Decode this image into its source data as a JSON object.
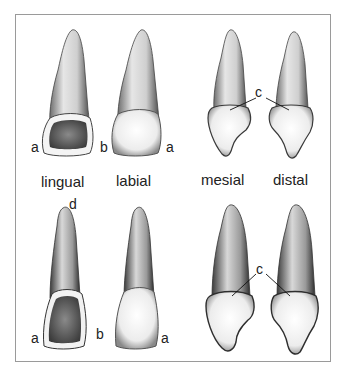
{
  "figure": {
    "view_labels": [
      "lingual",
      "labial",
      "mesial",
      "distal"
    ],
    "top_row": {
      "lingual": {
        "left_label": "a"
      },
      "labial": {
        "left_label": "b",
        "right_label": "a"
      },
      "mesial_distal_label": "c"
    },
    "bottom_row": {
      "lingual": {
        "left_label": "a",
        "tip_label": "d"
      },
      "labial": {
        "left_label": "b",
        "right_label": "a"
      },
      "mesial_distal_label": "c"
    }
  }
}
